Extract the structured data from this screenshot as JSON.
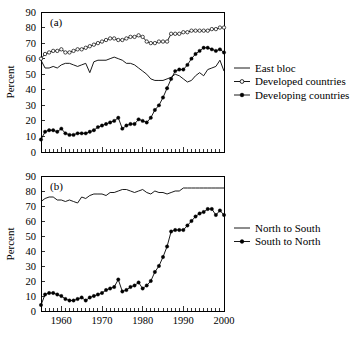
{
  "figure": {
    "width": 363,
    "height": 343,
    "background": "#ffffff",
    "ink_color": "#000000"
  },
  "chart_data": [
    {
      "id": "panel-a",
      "type": "line",
      "panel_label": "(a)",
      "title": "",
      "xlabel": "",
      "ylabel": "Percent",
      "xlim": [
        1955,
        2000
      ],
      "ylim": [
        0,
        90
      ],
      "yticks": [
        0,
        10,
        20,
        30,
        40,
        50,
        60,
        70,
        80,
        90
      ],
      "ytick_labels": [
        "0",
        "10",
        "20",
        "30",
        "40",
        "50",
        "60",
        "70",
        "80",
        "90"
      ],
      "xticks": [
        1960,
        1970,
        1980,
        1990,
        2000
      ],
      "xtick_labels": [
        "",
        "",
        "",
        "",
        ""
      ],
      "xminor_step": 1,
      "grid": false,
      "legend_position": "right",
      "x": [
        1955,
        1956,
        1957,
        1958,
        1959,
        1960,
        1961,
        1962,
        1963,
        1964,
        1965,
        1966,
        1967,
        1968,
        1969,
        1970,
        1971,
        1972,
        1973,
        1974,
        1975,
        1976,
        1977,
        1978,
        1979,
        1980,
        1981,
        1982,
        1983,
        1984,
        1985,
        1986,
        1987,
        1988,
        1989,
        1990,
        1991,
        1992,
        1993,
        1994,
        1995,
        1996,
        1997,
        1998,
        1999,
        2000
      ],
      "series": [
        {
          "name": "East bloc",
          "marker": "none",
          "values": [
            59,
            54,
            54,
            55,
            54,
            56,
            57,
            57,
            56,
            55,
            56,
            57,
            51,
            58,
            59,
            59,
            59,
            60,
            61,
            60,
            59,
            57,
            57,
            56,
            54,
            52,
            50,
            47,
            46,
            46,
            46,
            47,
            48,
            50,
            49,
            47,
            45,
            46,
            49,
            51,
            49,
            53,
            54,
            55,
            59,
            52
          ]
        },
        {
          "name": "Developed countries",
          "marker": "open-circle",
          "values": [
            60,
            63,
            64,
            65,
            65,
            66,
            64,
            64,
            65,
            66,
            66,
            67,
            68,
            69,
            70,
            71,
            72,
            73,
            73,
            72,
            72,
            73,
            74,
            74,
            75,
            74,
            71,
            70,
            70,
            71,
            71,
            71,
            76,
            76,
            76,
            77,
            77,
            78,
            78,
            78,
            78,
            78,
            79,
            79,
            80,
            80
          ]
        },
        {
          "name": "Developing countries",
          "marker": "filled-circle",
          "values": [
            8,
            13,
            14,
            14,
            13,
            15,
            12,
            11,
            11,
            12,
            12,
            12,
            13,
            14,
            16,
            17,
            18,
            19,
            20,
            22,
            15,
            17,
            18,
            18,
            21,
            20,
            19,
            22,
            27,
            30,
            35,
            41,
            47,
            52,
            53,
            53,
            56,
            60,
            63,
            65,
            67,
            67,
            66,
            65,
            66,
            64
          ]
        }
      ]
    },
    {
      "id": "panel-b",
      "type": "line",
      "panel_label": "(b)",
      "title": "",
      "xlabel": "",
      "ylabel": "Percent",
      "xlim": [
        1955,
        2000
      ],
      "ylim": [
        0,
        90
      ],
      "yticks": [
        0,
        10,
        20,
        30,
        40,
        50,
        60,
        70,
        80,
        90
      ],
      "ytick_labels": [
        "0",
        "10",
        "20",
        "30",
        "40",
        "50",
        "60",
        "70",
        "80",
        "90"
      ],
      "xticks": [
        1960,
        1970,
        1980,
        1990,
        2000
      ],
      "xtick_labels": [
        "1960",
        "1970",
        "1980",
        "1990",
        "2000"
      ],
      "xminor_step": 1,
      "grid": false,
      "legend_position": "right",
      "x": [
        1955,
        1956,
        1957,
        1958,
        1959,
        1960,
        1961,
        1962,
        1963,
        1964,
        1965,
        1966,
        1967,
        1968,
        1969,
        1970,
        1971,
        1972,
        1973,
        1974,
        1975,
        1976,
        1977,
        1978,
        1979,
        1980,
        1981,
        1982,
        1983,
        1984,
        1985,
        1986,
        1987,
        1988,
        1989,
        1990,
        1991,
        1992,
        1993,
        1994,
        1995,
        1996,
        1997,
        1998,
        1999,
        2000
      ],
      "series": [
        {
          "name": "North to South",
          "marker": "none",
          "values": [
            73,
            75,
            76,
            76,
            74,
            74,
            73,
            74,
            73,
            72,
            76,
            75,
            77,
            78,
            78,
            78,
            77,
            79,
            79,
            80,
            81,
            81,
            80,
            79,
            80,
            81,
            79,
            78,
            80,
            79,
            79,
            78,
            79,
            80,
            80,
            82,
            82,
            82,
            82,
            82,
            82,
            82,
            82,
            82,
            82,
            82
          ]
        },
        {
          "name": "South to North",
          "marker": "filled-circle",
          "values": [
            4,
            11,
            12,
            12,
            11,
            10,
            8,
            7,
            7,
            8,
            9,
            7,
            9,
            10,
            11,
            12,
            14,
            15,
            16,
            21,
            13,
            14,
            16,
            17,
            19,
            15,
            17,
            20,
            26,
            30,
            36,
            43,
            53,
            54,
            54,
            54,
            57,
            60,
            63,
            65,
            66,
            68,
            68,
            64,
            67,
            64
          ]
        }
      ]
    }
  ],
  "legends": [
    {
      "panel": "panel-a",
      "items": [
        {
          "label": "East bloc",
          "marker": "none"
        },
        {
          "label": "Developed countries",
          "marker": "open-circle"
        },
        {
          "label": "Developing countries",
          "marker": "filled-circle"
        }
      ]
    },
    {
      "panel": "panel-b",
      "items": [
        {
          "label": "North to South",
          "marker": "none"
        },
        {
          "label": "South to North",
          "marker": "filled-circle"
        }
      ]
    }
  ]
}
